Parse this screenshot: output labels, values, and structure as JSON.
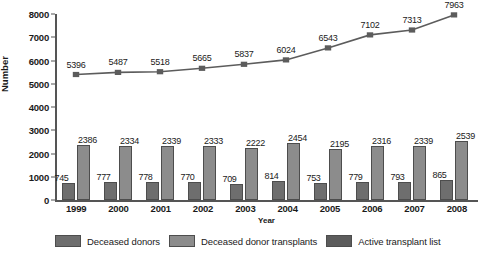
{
  "chart_data": {
    "type": "bar",
    "title": "",
    "xlabel": "Year",
    "ylabel": "Number",
    "categories": [
      "1999",
      "2000",
      "2001",
      "2002",
      "2003",
      "2004",
      "2005",
      "2006",
      "2007",
      "2008"
    ],
    "ylim": [
      0,
      8000
    ],
    "yticks": [
      "8000",
      "7000",
      "6000",
      "5000",
      "4000",
      "3000",
      "2000",
      "1000",
      "0"
    ],
    "grid": false,
    "legend_position": "bottom",
    "series": [
      {
        "name": "Deceased donors",
        "kind": "bar",
        "color": "#6e6e6e",
        "values": [
          745,
          777,
          778,
          770,
          709,
          814,
          753,
          779,
          793,
          865
        ]
      },
      {
        "name": "Deceased donor transplants",
        "kind": "bar",
        "color": "#8c8c8c",
        "values": [
          2386,
          2334,
          2339,
          2333,
          2222,
          2454,
          2195,
          2316,
          2339,
          2539
        ]
      },
      {
        "name": "Active transplant list",
        "kind": "line",
        "color": "#5c5c5c",
        "marker": "square",
        "values": [
          5396,
          5487,
          5518,
          5665,
          5837,
          6024,
          6543,
          7102,
          7313,
          7963
        ]
      }
    ]
  }
}
